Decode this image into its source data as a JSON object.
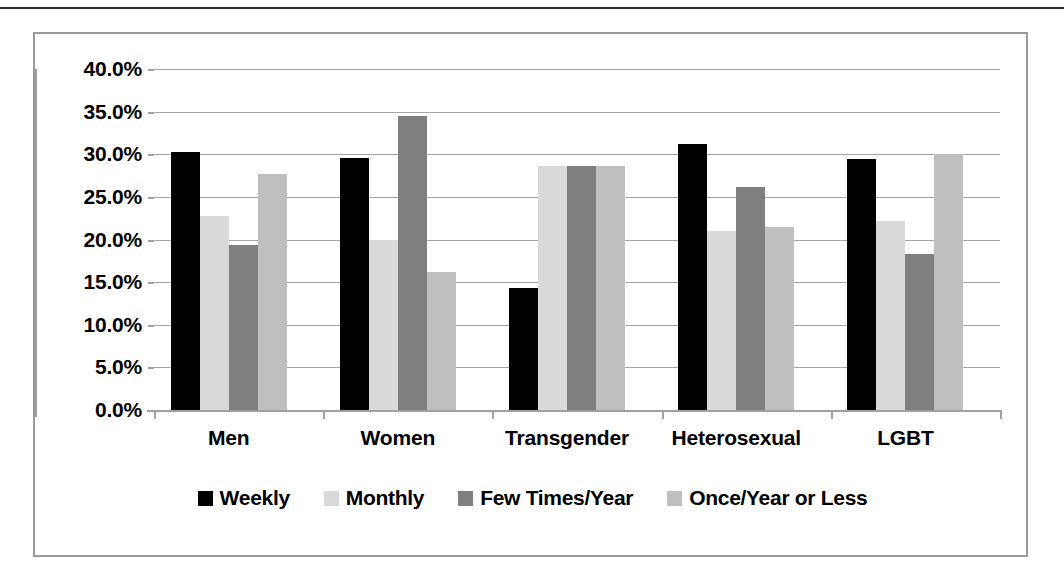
{
  "chart_data": {
    "type": "bar",
    "title": "",
    "subtitle": "",
    "xlabel": "",
    "ylabel": "",
    "ylim": [
      0,
      40
    ],
    "y_tick_step": 5,
    "y_tick_labels": [
      "40.0%",
      "35.0%",
      "30.0%",
      "25.0%",
      "20.0%",
      "15.0%",
      "10.0%",
      "5.0%",
      "0.0%"
    ],
    "y_tick_values": [
      40,
      35,
      30,
      25,
      20,
      15,
      10,
      5,
      0
    ],
    "grid": true,
    "legend_position": "bottom",
    "categories": [
      "Men",
      "Women",
      "Transgender",
      "Heterosexual",
      "LGBT"
    ],
    "series": [
      {
        "name": "Weekly",
        "color": "#000000",
        "values": [
          30.3,
          29.6,
          14.3,
          31.2,
          29.4
        ]
      },
      {
        "name": "Monthly",
        "color": "#d9d9d9",
        "values": [
          22.8,
          20.0,
          28.6,
          21.0,
          22.2
        ]
      },
      {
        "name": "Few Times/Year",
        "color": "#7f7f7f",
        "values": [
          19.3,
          34.5,
          28.6,
          26.2,
          18.3
        ]
      },
      {
        "name": "Once/Year or Less",
        "color": "#bfbfbf",
        "values": [
          27.7,
          16.2,
          28.6,
          21.5,
          30.0
        ]
      }
    ]
  },
  "colors": {
    "frame_border": "#9a9a9a",
    "gridline": "#a6a6a6",
    "axis": "#a0a0a0",
    "text": "#000000",
    "page_rule": "#2b2b2b",
    "background": "#ffffff"
  }
}
